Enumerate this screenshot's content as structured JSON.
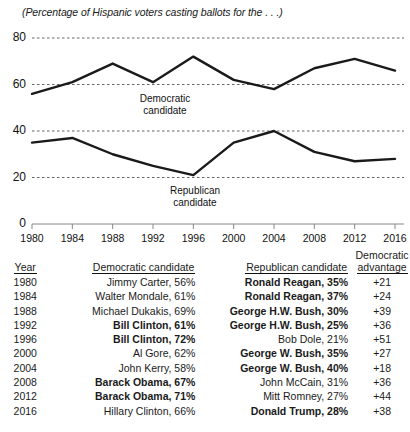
{
  "chart_data": {
    "type": "line",
    "title": "(Percentage of Hispanic voters casting ballots for the . . .)",
    "xlabel": "",
    "ylabel": "",
    "x": [
      1980,
      1984,
      1988,
      1992,
      1996,
      2000,
      2004,
      2008,
      2012,
      2016
    ],
    "xlim": [
      1980,
      2016
    ],
    "ylim": [
      0,
      80
    ],
    "yticks": [
      0,
      20,
      40,
      60,
      80
    ],
    "xticks": [
      "1980",
      "1984",
      "1988",
      "1992",
      "1996",
      "2000",
      "2004",
      "2008",
      "2012",
      "2016"
    ],
    "grid": true,
    "legend_position": "inline-annotation",
    "series": [
      {
        "name": "Democratic candidate",
        "values": [
          56,
          61,
          69,
          61,
          72,
          62,
          58,
          67,
          71,
          66
        ]
      },
      {
        "name": "Republican candidate",
        "values": [
          35,
          37,
          30,
          25,
          21,
          35,
          40,
          31,
          27,
          28
        ]
      }
    ],
    "annotations": [
      {
        "text_line1": "Democratic",
        "text_line2": "candidate"
      },
      {
        "text_line1": "Republican",
        "text_line2": "candidate"
      }
    ]
  },
  "table": {
    "headers": {
      "year": "Year",
      "democratic": "Democratic candidate",
      "republican": "Republican candidate",
      "advantage_line1": "Democratic",
      "advantage_line2": "advantage"
    },
    "rows": [
      {
        "year": "1980",
        "dem": "Jimmy Carter, 56%",
        "dem_bold": false,
        "rep": "Ronald Reagan, 35%",
        "rep_bold": true,
        "adv": "+21"
      },
      {
        "year": "1984",
        "dem": "Walter Mondale, 61%",
        "dem_bold": false,
        "rep": "Ronald Reagan, 37%",
        "rep_bold": true,
        "adv": "+24"
      },
      {
        "year": "1988",
        "dem": "Michael Dukakis, 69%",
        "dem_bold": false,
        "rep": "George H.W. Bush, 30%",
        "rep_bold": true,
        "adv": "+39"
      },
      {
        "year": "1992",
        "dem": "Bill Clinton, 61%",
        "dem_bold": true,
        "rep": "George H.W. Bush, 25%",
        "rep_bold": true,
        "adv": "+36"
      },
      {
        "year": "1996",
        "dem": "Bill Clinton, 72%",
        "dem_bold": true,
        "rep": "Bob Dole, 21%",
        "rep_bold": false,
        "adv": "+51"
      },
      {
        "year": "2000",
        "dem": "Al Gore, 62%",
        "dem_bold": false,
        "rep": "George W. Bush, 35%",
        "rep_bold": true,
        "adv": "+27"
      },
      {
        "year": "2004",
        "dem": "John Kerry, 58%",
        "dem_bold": false,
        "rep": "George W. Bush, 40%",
        "rep_bold": true,
        "adv": "+18"
      },
      {
        "year": "2008",
        "dem": "Barack Obama, 67%",
        "dem_bold": true,
        "rep": "John McCain, 31%",
        "rep_bold": false,
        "adv": "+36"
      },
      {
        "year": "2012",
        "dem": "Barack Obama, 71%",
        "dem_bold": true,
        "rep": "Mitt Romney, 27%",
        "rep_bold": false,
        "adv": "+44"
      },
      {
        "year": "2016",
        "dem": "Hillary Clinton, 66%",
        "dem_bold": false,
        "rep": "Donald Trump, 28%",
        "rep_bold": true,
        "adv": "+38"
      }
    ]
  },
  "colors": {
    "line": "#1a1a1a",
    "grid": "#555555",
    "axis": "#888888",
    "text": "#111111"
  }
}
